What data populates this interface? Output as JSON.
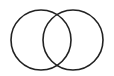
{
  "diagram": {
    "type": "venn",
    "sets": [
      {
        "id": "left",
        "cx": 41,
        "cy": 40,
        "r": 30
      },
      {
        "id": "right",
        "cx": 73,
        "cy": 40,
        "r": 30
      }
    ],
    "stroke_color": "#222222",
    "background": "#ffffff"
  }
}
